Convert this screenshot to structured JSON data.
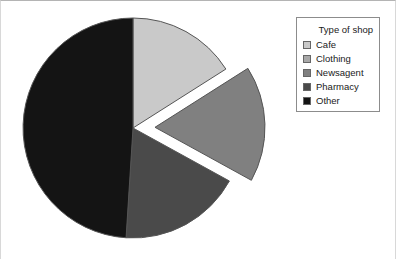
{
  "figure": {
    "background_color": "#ffffff",
    "border_color": "#b4b4b4"
  },
  "legend": {
    "title": "Type of shop",
    "position": "top-right",
    "border_color": "#8c8c8c",
    "entries": [
      {
        "label": "Cafe",
        "color": "#c9c9c9"
      },
      {
        "label": "Clothing",
        "color": "#a8a8a8"
      },
      {
        "label": "Newsagent",
        "color": "#808080"
      },
      {
        "label": "Pharmacy",
        "color": "#4a4a4a"
      },
      {
        "label": "Other",
        "color": "#141414"
      }
    ]
  },
  "pie": {
    "center_x": 133,
    "center_y": 128,
    "radius": 110,
    "start_angle_deg": 0,
    "direction": "clockwise",
    "slice_edge_color": "#555555",
    "gap_color": "#ffffff",
    "exploded_slice": "Newsagent",
    "explode_offset_px": 22
  },
  "chart_data": {
    "type": "pie",
    "title": "",
    "subtitle": "",
    "xlabel": "",
    "ylabel": "",
    "grid": false,
    "legend_position": "top-right",
    "legend_title": "Type of shop",
    "start_angle_deg": 90,
    "direction": "clockwise",
    "categories": [
      "Cafe",
      "Clothing",
      "Newsagent",
      "Pharmacy",
      "Other"
    ],
    "values": [
      16,
      0,
      17,
      18,
      49
    ],
    "colors": [
      "#c9c9c9",
      "#a8a8a8",
      "#808080",
      "#4a4a4a",
      "#141414"
    ],
    "exploded": [
      false,
      false,
      true,
      false,
      false
    ],
    "slice_angles_deg": [
      57,
      0,
      61,
      65,
      177
    ],
    "annotations": []
  }
}
